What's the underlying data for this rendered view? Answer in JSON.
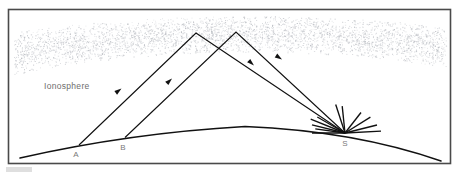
{
  "figure": {
    "background_color": "#ffffff",
    "frame_color": "#4a4a4a",
    "line_color": "#111111",
    "label_color": "#6e6e6e",
    "ionosphere_stipple_color": "#b9bcc2"
  },
  "labels": {
    "ionosphere": "Ionosphere",
    "point_a": "A",
    "point_b": "B",
    "point_s": "S"
  },
  "diagram_elements": {
    "earth_label": "Earth surface curve",
    "ionosphere_label": "Ionosphere stippled band",
    "transmitter_label": "Transmitter burst at S",
    "ray_ab_label": "Reflected ray path S to A",
    "ray_b_label": "Reflected ray path S to B"
  },
  "geometry": {
    "frame": {
      "x": 8,
      "y": 9,
      "width": 443,
      "height": 155
    },
    "earth_curve": {
      "start_x": 20,
      "start_y": 157,
      "peak_x": 245,
      "peak_y": 126,
      "end_x": 440,
      "end_y": 160
    },
    "point_a": {
      "x": 79,
      "y": 145
    },
    "point_b": {
      "x": 125,
      "y": 138
    },
    "point_s": {
      "x": 345,
      "y": 133
    },
    "peak_left": {
      "x": 196,
      "y": 33
    },
    "peak_right": {
      "x": 236,
      "y": 32
    },
    "arrow_count": 4,
    "burst_ray_count": 11
  }
}
